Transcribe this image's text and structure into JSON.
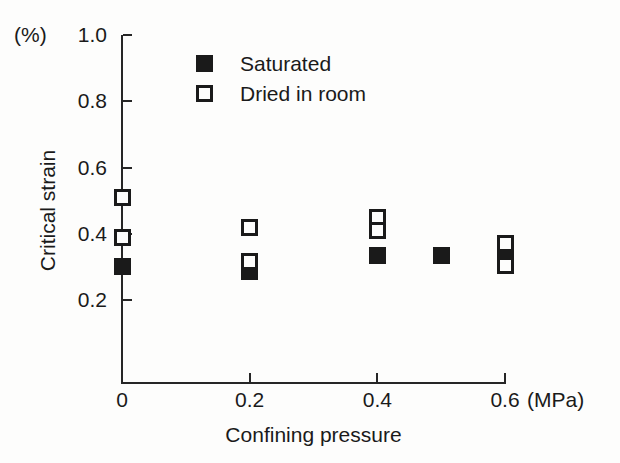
{
  "chart_data": {
    "type": "scatter",
    "title": "",
    "xlabel": "Confining pressure",
    "ylabel": "Critical strain",
    "x_unit": "(MPa)",
    "y_unit": "(%)",
    "xlim": [
      0,
      0.6
    ],
    "ylim": [
      0,
      1.0
    ],
    "x_ticks": [
      0,
      0.2,
      0.4,
      0.6
    ],
    "x_tick_labels": [
      "0",
      "0.2",
      "0.4",
      "0.6"
    ],
    "y_ticks": [
      0.2,
      0.4,
      0.6,
      0.8,
      1.0
    ],
    "y_tick_labels": [
      "0.2",
      "0.4",
      "0.6",
      "0.8",
      "1.0"
    ],
    "grid": false,
    "legend_position": "top-center",
    "series": [
      {
        "name": "Saturated",
        "marker": "filled-square",
        "color": "#1a1a1a",
        "points": [
          {
            "x": 0.0,
            "y": 0.3
          },
          {
            "x": 0.2,
            "y": 0.285
          },
          {
            "x": 0.4,
            "y": 0.335
          },
          {
            "x": 0.5,
            "y": 0.335
          },
          {
            "x": 0.6,
            "y": 0.34
          }
        ]
      },
      {
        "name": "Dried in room",
        "marker": "open-square",
        "color": "#1a1a1a",
        "points": [
          {
            "x": 0.0,
            "y": 0.51
          },
          {
            "x": 0.0,
            "y": 0.39
          },
          {
            "x": 0.2,
            "y": 0.42
          },
          {
            "x": 0.2,
            "y": 0.315
          },
          {
            "x": 0.4,
            "y": 0.45
          },
          {
            "x": 0.4,
            "y": 0.41
          },
          {
            "x": 0.6,
            "y": 0.37
          },
          {
            "x": 0.6,
            "y": 0.305
          }
        ]
      }
    ]
  },
  "legend": {
    "items": [
      {
        "label": "Saturated",
        "marker": "filled"
      },
      {
        "label": "Dried in room",
        "marker": "open"
      }
    ]
  }
}
